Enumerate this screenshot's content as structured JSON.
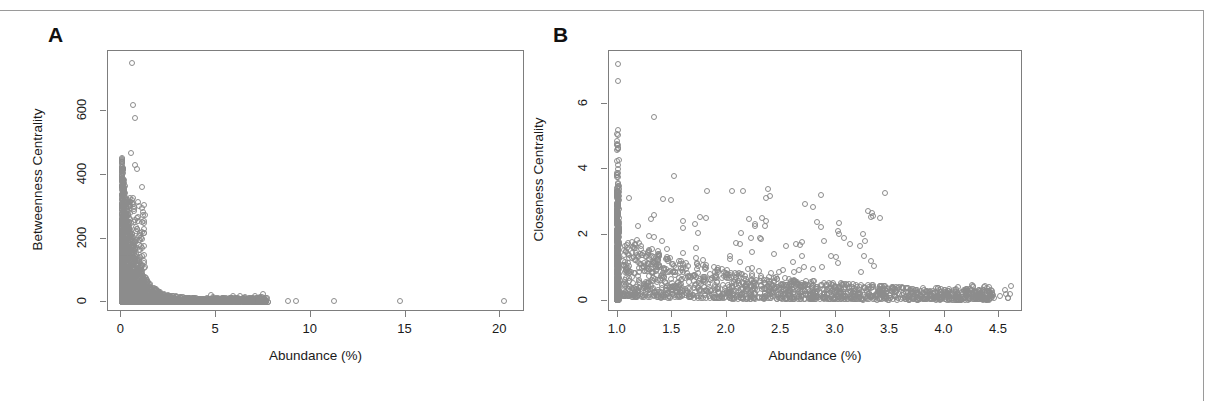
{
  "figure": {
    "background": "#ffffff",
    "border_color": "#9a9a9a",
    "point_color": "#8c8c8c",
    "axis_color": "#7d7d7d"
  },
  "panels": [
    {
      "label": "A",
      "xlabel": "Abundance (%)",
      "ylabel": "Betweenness Centrality",
      "xticks": [
        "0",
        "5",
        "10",
        "15",
        "20"
      ],
      "yticks": [
        "0",
        "200",
        "400",
        "600"
      ]
    },
    {
      "label": "B",
      "xlabel": "Abundance (%)",
      "ylabel": "Closeness Centrality",
      "xticks": [
        "1.0",
        "1.5",
        "2.0",
        "2.5",
        "3.0",
        "3.5",
        "4.0",
        "4.5"
      ],
      "yticks": [
        "0",
        "2",
        "4",
        "6"
      ]
    }
  ],
  "chart_data": [
    {
      "type": "scatter",
      "panel": "A",
      "title": "",
      "xlabel": "Abundance (%)",
      "ylabel": "Betweenness Centrality",
      "xlim": [
        -0.7,
        21.3
      ],
      "ylim": [
        -30,
        790
      ],
      "xticks": [
        0,
        5,
        10,
        15,
        20
      ],
      "yticks": [
        0,
        200,
        400,
        600
      ],
      "grid": false,
      "legend": "none",
      "marker": "open-circle",
      "n_points_approx": 2000,
      "description": "Dense L-shaped power-law decay: betweenness centrality falls sharply as abundance rises; a thick near-vertical cluster of points sits between 0 and 1.5% abundance spanning 0 to ~470, with isolated high outliers near 750, 620 and 580; a long sparse tail of near-zero points extends to 20.2% abundance.",
      "outliers": [
        {
          "x": 0.55,
          "y": 752
        },
        {
          "x": 0.6,
          "y": 620
        },
        {
          "x": 0.75,
          "y": 580
        },
        {
          "x": 0.5,
          "y": 470
        },
        {
          "x": 0.7,
          "y": 432
        },
        {
          "x": 0.85,
          "y": 418
        },
        {
          "x": 1.1,
          "y": 362
        },
        {
          "x": 8.8,
          "y": 4
        },
        {
          "x": 9.2,
          "y": 4
        },
        {
          "x": 11.2,
          "y": 5
        },
        {
          "x": 14.7,
          "y": 4
        },
        {
          "x": 20.2,
          "y": 4
        }
      ]
    },
    {
      "type": "scatter",
      "panel": "B",
      "title": "",
      "xlabel": "Abundance (%)",
      "ylabel": "Closeness Centrality",
      "xlim": [
        0.92,
        4.72
      ],
      "ylim": [
        -0.35,
        7.6
      ],
      "xticks": [
        1.0,
        1.5,
        2.0,
        2.5,
        3.0,
        3.5,
        4.0,
        4.5
      ],
      "yticks": [
        0,
        2,
        4,
        6
      ],
      "grid": false,
      "legend": "none",
      "marker": "open-circle",
      "n_points_approx": 2000,
      "description": "Dense vertical stripe of points at abundance 1.0 spanning closeness centrality 0 to ~5.2 with isolated high values at 7.2 and 6.7; the main cloud decays from ~1.5 near abundance 1.1 toward ~0.2 by abundance 4.0, with scattered mid-range outliers between 3 and 5.6.",
      "outliers": [
        {
          "x": 1.0,
          "y": 7.2
        },
        {
          "x": 1.0,
          "y": 6.7
        },
        {
          "x": 1.33,
          "y": 5.6
        },
        {
          "x": 1.0,
          "y": 5.2
        },
        {
          "x": 1.0,
          "y": 5.05
        },
        {
          "x": 1.0,
          "y": 4.6
        },
        {
          "x": 1.0,
          "y": 4.0
        },
        {
          "x": 1.52,
          "y": 3.8
        },
        {
          "x": 1.82,
          "y": 3.35
        },
        {
          "x": 2.05,
          "y": 3.35
        },
        {
          "x": 2.38,
          "y": 3.4
        },
        {
          "x": 1.33,
          "y": 2.6
        },
        {
          "x": 4.6,
          "y": 0.2
        }
      ]
    }
  ]
}
